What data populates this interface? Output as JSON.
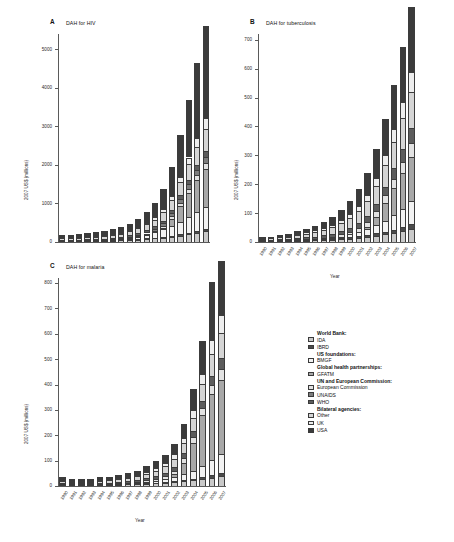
{
  "figure": {
    "top_caption": "",
    "units_label": "2007 US$ (millions)",
    "x_axis_label": "Year",
    "years": [
      "1990",
      "1991",
      "1992",
      "1993",
      "1994",
      "1995",
      "1996",
      "1997",
      "1998",
      "1999",
      "2000",
      "2001",
      "2002",
      "2003",
      "2004",
      "2005",
      "2006",
      "2007"
    ]
  },
  "panels": [
    {
      "letter": "A",
      "title": "DAH for HIV"
    },
    {
      "letter": "B",
      "title": "DAH for tuberculosis"
    },
    {
      "letter": "C",
      "title": "DAH for malaria"
    }
  ],
  "legend": {
    "groups": [
      {
        "header": "World Bank:",
        "items": [
          {
            "label": "IDA",
            "color": "#c9c9c9"
          },
          {
            "label": "IBRD",
            "color": "#4a4a4a"
          }
        ]
      },
      {
        "header": "US foundations:",
        "items": [
          {
            "label": "BMGF",
            "color": "#f2f2f2"
          }
        ]
      },
      {
        "header": "Global health partnerships:",
        "items": [
          {
            "label": "GFATM",
            "color": "#a8a8a8"
          }
        ]
      },
      {
        "header": "UN and European Commission:",
        "items": [
          {
            "label": "European Commission",
            "color": "#e2e2e2"
          },
          {
            "label": "UNAIDS",
            "color": "#7d7d7d"
          },
          {
            "label": "WHO",
            "color": "#5c5c5c"
          }
        ]
      },
      {
        "header": "Bilateral agencies:",
        "items": [
          {
            "label": "Other",
            "color": "#d5d5d5"
          },
          {
            "label": "UK",
            "color": "#ededed"
          },
          {
            "label": "USA",
            "color": "#3b3b3b"
          }
        ]
      }
    ]
  },
  "chart_data": [
    {
      "type": "bar",
      "stacked": true,
      "panel": "A",
      "title": "DAH for HIV",
      "xlabel": "Year",
      "ylabel": "2007 US$ (millions)",
      "ylim": [
        0,
        5400
      ],
      "yticks": [
        0,
        1000,
        2000,
        3000,
        4000,
        5000
      ],
      "grid": false,
      "legend_position": "right",
      "categories": [
        "1990",
        "1991",
        "1992",
        "1993",
        "1994",
        "1995",
        "1996",
        "1997",
        "1998",
        "1999",
        "2000",
        "2001",
        "2002",
        "2003",
        "2004",
        "2005",
        "2006",
        "2007"
      ],
      "series": [
        {
          "name": "USA",
          "color": "#3b3b3b",
          "values": [
            70,
            75,
            85,
            95,
            105,
            115,
            130,
            150,
            175,
            215,
            275,
            360,
            520,
            760,
            1080,
            1480,
            1950,
            2400
          ]
        },
        {
          "name": "UK",
          "color": "#ededed",
          "values": [
            8,
            9,
            10,
            12,
            14,
            16,
            19,
            22,
            27,
            34,
            45,
            60,
            80,
            105,
            140,
            180,
            230,
            280
          ]
        },
        {
          "name": "Other",
          "color": "#d5d5d5",
          "values": [
            40,
            44,
            48,
            53,
            58,
            64,
            72,
            82,
            95,
            115,
            140,
            175,
            215,
            265,
            330,
            400,
            480,
            560
          ]
        },
        {
          "name": "WHO",
          "color": "#5c5c5c",
          "values": [
            22,
            23,
            24,
            26,
            28,
            30,
            33,
            36,
            40,
            45,
            52,
            60,
            70,
            82,
            96,
            112,
            130,
            150
          ]
        },
        {
          "name": "UNAIDS",
          "color": "#7d7d7d",
          "values": [
            0,
            0,
            0,
            0,
            0,
            0,
            18,
            22,
            28,
            34,
            42,
            52,
            64,
            78,
            95,
            115,
            138,
            165
          ]
        },
        {
          "name": "European Commission",
          "color": "#e2e2e2",
          "values": [
            6,
            7,
            8,
            9,
            11,
            13,
            15,
            18,
            22,
            27,
            34,
            43,
            54,
            68,
            85,
            105,
            128,
            155
          ]
        },
        {
          "name": "GFATM",
          "color": "#a8a8a8",
          "values": [
            0,
            0,
            0,
            0,
            0,
            0,
            0,
            0,
            0,
            0,
            0,
            0,
            40,
            180,
            420,
            640,
            830,
            1000
          ]
        },
        {
          "name": "BMGF",
          "color": "#f2f2f2",
          "values": [
            0,
            0,
            0,
            0,
            0,
            0,
            0,
            0,
            25,
            55,
            95,
            140,
            190,
            250,
            320,
            400,
            480,
            560
          ]
        },
        {
          "name": "IBRD",
          "color": "#4a4a4a",
          "values": [
            4,
            5,
            5,
            6,
            7,
            8,
            9,
            10,
            12,
            14,
            17,
            20,
            24,
            29,
            35,
            42,
            50,
            58
          ]
        },
        {
          "name": "IDA",
          "color": "#c9c9c9",
          "values": [
            20,
            22,
            24,
            27,
            30,
            34,
            38,
            44,
            52,
            62,
            75,
            92,
            112,
            136,
            165,
            200,
            240,
            280
          ]
        }
      ]
    },
    {
      "type": "bar",
      "stacked": true,
      "panel": "B",
      "title": "DAH for tuberculosis",
      "xlabel": "Year",
      "ylabel": "2007 US$ (millions)",
      "ylim": [
        0,
        720
      ],
      "yticks": [
        0,
        100,
        200,
        300,
        400,
        500,
        600,
        700
      ],
      "grid": false,
      "legend_position": "right",
      "categories": [
        "1990",
        "1991",
        "1992",
        "1993",
        "1994",
        "1995",
        "1996",
        "1997",
        "1998",
        "1999",
        "2000",
        "2001",
        "2002",
        "2003",
        "2004",
        "2005",
        "2006",
        "2007"
      ],
      "series": [
        {
          "name": "USA",
          "color": "#3b3b3b",
          "values": [
            4,
            5,
            6,
            8,
            10,
            13,
            16,
            20,
            26,
            34,
            44,
            58,
            76,
            98,
            125,
            155,
            190,
            225
          ]
        },
        {
          "name": "UK",
          "color": "#ededed",
          "values": [
            1,
            1,
            2,
            2,
            3,
            4,
            5,
            6,
            8,
            10,
            13,
            17,
            22,
            28,
            36,
            45,
            56,
            68
          ]
        },
        {
          "name": "Other",
          "color": "#d5d5d5",
          "values": [
            5,
            6,
            7,
            9,
            11,
            13,
            16,
            19,
            23,
            28,
            34,
            42,
            51,
            62,
            75,
            90,
            108,
            128
          ]
        },
        {
          "name": "WHO",
          "color": "#5c5c5c",
          "values": [
            3,
            3,
            4,
            4,
            5,
            6,
            7,
            8,
            10,
            12,
            14,
            17,
            21,
            25,
            30,
            36,
            43,
            51
          ]
        },
        {
          "name": "UNAIDS",
          "color": "#7d7d7d",
          "values": [
            0,
            0,
            0,
            0,
            0,
            0,
            0,
            0,
            0,
            0,
            0,
            0,
            0,
            0,
            0,
            0,
            0,
            0
          ]
        },
        {
          "name": "European Commission",
          "color": "#e2e2e2",
          "values": [
            1,
            1,
            2,
            2,
            3,
            3,
            4,
            5,
            6,
            8,
            10,
            13,
            16,
            20,
            25,
            31,
            38,
            46
          ]
        },
        {
          "name": "GFATM",
          "color": "#a8a8a8",
          "values": [
            0,
            0,
            0,
            0,
            0,
            0,
            0,
            0,
            0,
            0,
            0,
            0,
            8,
            30,
            62,
            95,
            125,
            155
          ]
        },
        {
          "name": "BMGF",
          "color": "#f2f2f2",
          "values": [
            0,
            0,
            0,
            0,
            0,
            0,
            0,
            0,
            2,
            5,
            9,
            14,
            20,
            28,
            38,
            50,
            64,
            80
          ]
        },
        {
          "name": "IBRD",
          "color": "#4a4a4a",
          "values": [
            1,
            1,
            1,
            1,
            2,
            2,
            2,
            3,
            3,
            4,
            5,
            6,
            7,
            8,
            10,
            12,
            14,
            17
          ]
        },
        {
          "name": "IDA",
          "color": "#c9c9c9",
          "values": [
            2,
            2,
            3,
            3,
            4,
            5,
            6,
            7,
            8,
            10,
            12,
            15,
            18,
            22,
            26,
            31,
            37,
            44
          ]
        }
      ]
    },
    {
      "type": "bar",
      "stacked": true,
      "panel": "C",
      "title": "DAH for malaria",
      "xlabel": "Year",
      "ylabel": "2007 US$ (millions)",
      "ylim": [
        0,
        820
      ],
      "yticks": [
        0,
        100,
        200,
        300,
        400,
        500,
        600,
        700,
        800
      ],
      "grid": false,
      "legend_position": "right",
      "categories": [
        "1990",
        "1991",
        "1992",
        "1993",
        "1994",
        "1995",
        "1996",
        "1997",
        "1998",
        "1999",
        "2000",
        "2001",
        "2002",
        "2003",
        "2004",
        "2005",
        "2006",
        "2007"
      ],
      "series": [
        {
          "name": "USA",
          "color": "#3b3b3b",
          "values": [
            14,
            10,
            9,
            9,
            10,
            11,
            12,
            14,
            17,
            21,
            26,
            33,
            42,
            55,
            85,
            130,
            230,
            215
          ]
        },
        {
          "name": "UK",
          "color": "#ededed",
          "values": [
            2,
            2,
            2,
            2,
            3,
            3,
            4,
            5,
            6,
            8,
            10,
            13,
            17,
            22,
            30,
            40,
            55,
            70
          ]
        },
        {
          "name": "Other",
          "color": "#d5d5d5",
          "values": [
            8,
            7,
            7,
            7,
            8,
            9,
            10,
            12,
            14,
            17,
            21,
            26,
            32,
            40,
            52,
            66,
            86,
            100
          ]
        },
        {
          "name": "WHO",
          "color": "#5c5c5c",
          "values": [
            4,
            4,
            4,
            4,
            5,
            5,
            6,
            7,
            8,
            9,
            11,
            13,
            16,
            19,
            23,
            28,
            34,
            40
          ]
        },
        {
          "name": "UNAIDS",
          "color": "#7d7d7d",
          "values": [
            0,
            0,
            0,
            0,
            0,
            0,
            0,
            0,
            0,
            0,
            0,
            0,
            0,
            0,
            0,
            0,
            0,
            0
          ]
        },
        {
          "name": "European Commission",
          "color": "#e2e2e2",
          "values": [
            2,
            2,
            2,
            2,
            3,
            3,
            4,
            4,
            5,
            7,
            9,
            11,
            14,
            18,
            23,
            29,
            37,
            45
          ]
        },
        {
          "name": "GFATM",
          "color": "#a8a8a8",
          "values": [
            0,
            0,
            0,
            0,
            0,
            0,
            0,
            0,
            0,
            0,
            0,
            0,
            10,
            45,
            110,
            200,
            260,
            290
          ]
        },
        {
          "name": "BMGF",
          "color": "#f2f2f2",
          "values": [
            0,
            0,
            0,
            0,
            0,
            0,
            0,
            0,
            2,
            4,
            7,
            11,
            16,
            23,
            32,
            44,
            58,
            75
          ]
        },
        {
          "name": "IBRD",
          "color": "#4a4a4a",
          "values": [
            1,
            1,
            1,
            1,
            1,
            1,
            2,
            2,
            2,
            3,
            3,
            4,
            5,
            6,
            7,
            9,
            11,
            13
          ]
        },
        {
          "name": "IDA",
          "color": "#c9c9c9",
          "values": [
            3,
            3,
            3,
            3,
            4,
            4,
            5,
            6,
            7,
            8,
            10,
            12,
            15,
            18,
            22,
            27,
            33,
            40
          ]
        }
      ]
    }
  ]
}
